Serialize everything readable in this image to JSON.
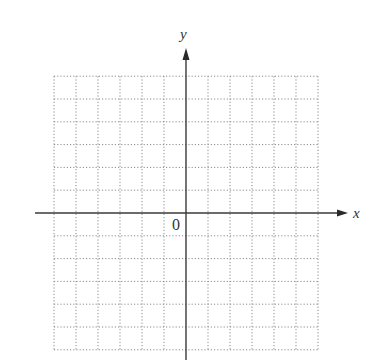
{
  "diagram": {
    "type": "coordinate_plane_grid",
    "x_axis_label": "x",
    "y_axis_label": "y",
    "origin_label": "0",
    "grid": {
      "columns_left_of_y_axis": 6,
      "columns_right_of_y_axis": 6,
      "rows_above_x_axis": 6,
      "rows_below_x_axis": 6,
      "line_style": "dotted"
    },
    "colors": {
      "axis": "#3a3a3a",
      "grid": "#8a8a8a",
      "background": "#ffffff"
    }
  }
}
